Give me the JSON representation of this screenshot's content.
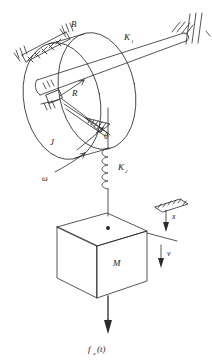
{
  "figure": {
    "type": "engineering-schematic",
    "stroke_color": "#2b2b2b",
    "background": "#ffffff"
  },
  "labels": {
    "damper_B": "B",
    "shaft_spring_K1": "K",
    "shaft_spring_K1_sub": "1",
    "disk_radius_R": "R",
    "disk_inertia_J": "J",
    "angle_theta": "θ",
    "angular_velocity_omega": "ω",
    "spring_K2": "K",
    "spring_K2_sub": "2",
    "mass_M": "M",
    "displacement_x": "x",
    "velocity_v": "v",
    "applied_force": "f",
    "applied_force_sub": "a",
    "applied_force_arg": "(t)"
  },
  "components": {
    "disk": {
      "name": "rotating-disk",
      "radius_label": "R",
      "inertia_label": "J"
    },
    "damper": {
      "name": "rotational-damper",
      "label": "B"
    },
    "shaft": {
      "name": "torsional-shaft",
      "label": "K1",
      "anchored_to": "fixed-wall"
    },
    "spring": {
      "name": "translational-spring",
      "label": "K2"
    },
    "mass": {
      "name": "block-mass",
      "label": "M"
    },
    "force": {
      "name": "applied-force",
      "label": "fa(t)",
      "direction": "down"
    }
  }
}
